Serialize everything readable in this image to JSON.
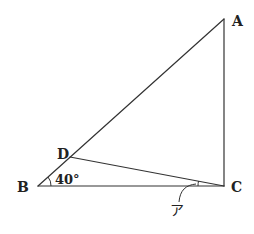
{
  "diagram": {
    "type": "geometry-triangle",
    "points": {
      "A": "A",
      "B": "B",
      "C": "C",
      "D": "D"
    },
    "segments": [
      "AB",
      "BC",
      "CA",
      "DC"
    ],
    "right_angle_at": "C",
    "point_on_segment": {
      "D": "AB"
    },
    "angle_labels": {
      "angle_B": "40°",
      "angle_DCB": "ア"
    },
    "colors": {
      "line": "#333333",
      "text": "#222222",
      "background": "#ffffff"
    }
  }
}
